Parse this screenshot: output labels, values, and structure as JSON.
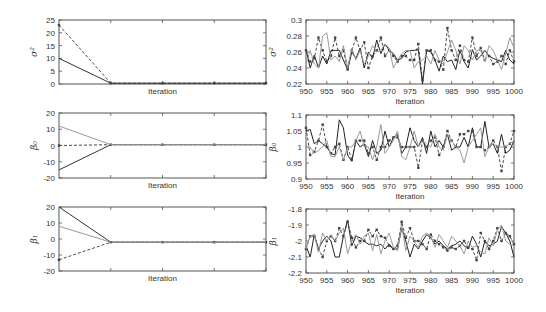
{
  "chart_data": [
    {
      "id": "sigma2-burnin",
      "type": "line",
      "ylabel": "σ²",
      "xlabel": "Iteration",
      "box": [
        59,
        20,
        266,
        84
      ],
      "ylim": [
        0,
        25
      ],
      "xlim": [
        0,
        4
      ],
      "yticks": [
        0,
        5,
        10,
        15,
        20,
        25
      ],
      "xticks": [],
      "series": [
        {
          "name": "chain-solid",
          "style": "solid",
          "color": "#333333",
          "x": [
            0,
            1,
            2,
            3,
            4
          ],
          "y": [
            10,
            0.3,
            0.3,
            0.3,
            0.3
          ]
        },
        {
          "name": "chain-dashed",
          "style": "dashed",
          "color": "#333333",
          "x": [
            0,
            1,
            2,
            3,
            4
          ],
          "y": [
            23,
            0.3,
            0.3,
            0.3,
            0.3
          ]
        }
      ]
    },
    {
      "id": "sigma2-trace",
      "type": "line",
      "ylabel": "σ²",
      "xlabel": "Iteration",
      "box": [
        306,
        20,
        514,
        84
      ],
      "ylim": [
        0.22,
        0.3
      ],
      "xlim": [
        950,
        1000
      ],
      "yticks": [
        0.22,
        0.24,
        0.26,
        0.28,
        0.3
      ],
      "xticks": [
        950,
        955,
        960,
        965,
        970,
        975,
        980,
        985,
        990,
        995,
        1000
      ],
      "series": [
        {
          "name": "chain-solid",
          "style": "solid",
          "color": "#222222",
          "y": [
            0.263,
            0.24,
            0.256,
            0.24,
            0.255,
            0.245,
            0.262,
            0.262,
            0.262,
            0.25,
            0.238,
            0.26,
            0.252,
            0.265,
            0.24,
            0.26,
            0.252,
            0.275,
            0.258,
            0.27,
            0.262,
            0.258,
            0.25,
            0.252,
            0.26,
            0.262,
            0.262,
            0.263,
            0.22,
            0.262,
            0.26,
            0.25,
            0.236,
            0.255,
            0.248,
            0.25,
            0.238,
            0.262,
            0.248,
            0.24,
            0.263,
            0.25,
            0.255,
            0.262,
            0.255,
            0.252,
            0.25,
            0.248,
            0.262,
            0.25,
            0.245
          ]
        },
        {
          "name": "chain-dashed",
          "style": "dashed",
          "color": "#333333",
          "y": [
            0.262,
            0.248,
            0.252,
            0.278,
            0.262,
            0.248,
            0.255,
            0.278,
            0.255,
            0.262,
            0.238,
            0.262,
            0.278,
            0.262,
            0.272,
            0.24,
            0.255,
            0.262,
            0.278,
            0.255,
            0.262,
            0.255,
            0.248,
            0.255,
            0.255,
            0.25,
            0.25,
            0.27,
            0.225,
            0.262,
            0.262,
            0.25,
            0.248,
            0.238,
            0.29,
            0.262,
            0.25,
            0.268,
            0.25,
            0.248,
            0.278,
            0.255,
            0.265,
            0.25,
            0.255,
            0.245,
            0.248,
            0.255,
            0.245,
            0.262,
            0.248
          ]
        },
        {
          "name": "chain-gray",
          "style": "solid",
          "color": "#9a9a9a",
          "y": [
            0.245,
            0.262,
            0.245,
            0.24,
            0.28,
            0.284,
            0.25,
            0.255,
            0.248,
            0.268,
            0.24,
            0.265,
            0.25,
            0.262,
            0.245,
            0.255,
            0.268,
            0.26,
            0.262,
            0.27,
            0.265,
            0.24,
            0.25,
            0.258,
            0.262,
            0.262,
            0.24,
            0.248,
            0.25,
            0.255,
            0.245,
            0.262,
            0.25,
            0.245,
            0.26,
            0.275,
            0.262,
            0.245,
            0.268,
            0.262,
            0.25,
            0.262,
            0.262,
            0.248,
            0.268,
            0.262,
            0.25,
            0.238,
            0.258,
            0.278,
            0.265
          ]
        }
      ]
    },
    {
      "id": "beta0-burnin",
      "type": "line",
      "ylabel": "β₀",
      "xlabel": "Iteration",
      "box": [
        59,
        113,
        266,
        178
      ],
      "ylim": [
        -20,
        20
      ],
      "xlim": [
        0,
        4
      ],
      "yticks": [
        -20,
        -10,
        0,
        10,
        20
      ],
      "xticks": [],
      "series": [
        {
          "name": "chain-solid",
          "style": "solid",
          "color": "#333333",
          "x": [
            0,
            1,
            2,
            3,
            4
          ],
          "y": [
            -15,
            0.5,
            0.5,
            0.5,
            0.5
          ]
        },
        {
          "name": "chain-dashed",
          "style": "dashed",
          "color": "#333333",
          "x": [
            0,
            1,
            2,
            3,
            4
          ],
          "y": [
            0,
            0.5,
            0.5,
            0.5,
            0.5
          ]
        },
        {
          "name": "chain-gray",
          "style": "solid",
          "color": "#9a9a9a",
          "x": [
            0,
            1,
            2,
            3,
            4
          ],
          "y": [
            12,
            0.5,
            0.5,
            0.5,
            0.5
          ]
        }
      ]
    },
    {
      "id": "beta0-trace",
      "type": "line",
      "ylabel": "β₀",
      "xlabel": "Iteration",
      "box": [
        306,
        115,
        514,
        179
      ],
      "ylim": [
        0.9,
        1.1
      ],
      "xlim": [
        950,
        1000
      ],
      "yticks": [
        0.9,
        0.95,
        1,
        1.05,
        1.1
      ],
      "xticks": [
        950,
        955,
        960,
        965,
        970,
        975,
        980,
        985,
        990,
        995,
        1000
      ],
      "series": [
        {
          "name": "chain-solid",
          "style": "solid",
          "color": "#222222",
          "y": [
            1.05,
            1.055,
            1.01,
            1.02,
            1.01,
            1.0,
            0.98,
            0.975,
            1.085,
            1.06,
            0.975,
            0.955,
            1.02,
            1.0,
            1.01,
            0.97,
            1.02,
            0.98,
            0.99,
            1.05,
            1.0,
            1.03,
            1.04,
            0.98,
            1.0,
            1.06,
            1.02,
            1.0,
            1.03,
            0.98,
            1.05,
            1.0,
            1.02,
            1.0,
            1.04,
            0.99,
            1.0,
            1.0,
            1.03,
            1.0,
            1.06,
            1.0,
            1.0,
            1.08,
            1.0,
            1.01,
            0.98,
            1.04,
            0.98,
            0.99,
            1.02
          ]
        },
        {
          "name": "chain-dashed",
          "style": "dashed",
          "color": "#333333",
          "y": [
            1.06,
            0.975,
            0.985,
            1.02,
            1.07,
            1.0,
            0.98,
            1.0,
            1.01,
            0.96,
            1.0,
            0.96,
            1.02,
            1.02,
            1.02,
            0.98,
            1.0,
            0.96,
            1.0,
            1.0,
            1.02,
            1.03,
            1.03,
            1.0,
            1.0,
            1.0,
            1.0,
            0.935,
            1.02,
            1.0,
            1.02,
            1.03,
            0.975,
            1.0,
            1.05,
            1.02,
            1.0,
            1.04,
            1.04,
            1.05,
            1.05,
            1.0,
            1.0,
            0.99,
            1.0,
            1.02,
            1.0,
            0.925,
            1.0,
            1.01,
            1.05
          ]
        },
        {
          "name": "chain-gray",
          "style": "solid",
          "color": "#9a9a9a",
          "y": [
            1.0,
            1.0,
            0.98,
            0.99,
            1.0,
            1.02,
            0.97,
            0.97,
            1.0,
            0.96,
            1.0,
            1.0,
            1.02,
            1.05,
            1.0,
            1.0,
            0.96,
            1.0,
            1.07,
            0.98,
            1.0,
            1.02,
            1.05,
            0.97,
            0.96,
            1.0,
            1.05,
            1.0,
            1.02,
            1.01,
            1.0,
            1.04,
            1.0,
            0.99,
            1.04,
            1.02,
            1.0,
            0.99,
            0.95,
            1.0,
            1.02,
            1.04,
            1.06,
            0.97,
            1.0,
            1.01,
            1.0,
            1.0,
            1.0,
            1.01,
            1.02
          ]
        }
      ]
    },
    {
      "id": "beta1-burnin",
      "type": "line",
      "ylabel": "β₁",
      "xlabel": "Iteration",
      "box": [
        59,
        207,
        266,
        271
      ],
      "ylim": [
        -20,
        20
      ],
      "xlim": [
        0,
        4
      ],
      "yticks": [
        -20,
        -10,
        0,
        10,
        20
      ],
      "xticks": [],
      "series": [
        {
          "name": "chain-solid",
          "style": "solid",
          "color": "#333333",
          "x": [
            0,
            1,
            2,
            3,
            4
          ],
          "y": [
            20,
            -2,
            -2,
            -2,
            -2
          ]
        },
        {
          "name": "chain-dashed",
          "style": "dashed",
          "color": "#333333",
          "x": [
            0,
            1,
            2,
            3,
            4
          ],
          "y": [
            -13,
            -2,
            -2,
            -2,
            -2
          ]
        },
        {
          "name": "chain-gray",
          "style": "solid",
          "color": "#9a9a9a",
          "x": [
            0,
            1,
            2,
            3,
            4
          ],
          "y": [
            8,
            -2,
            -2,
            -2,
            -2
          ]
        }
      ]
    },
    {
      "id": "beta1-trace",
      "type": "line",
      "ylabel": "β₁",
      "xlabel": "Iteration",
      "box": [
        306,
        209,
        514,
        273
      ],
      "ylim": [
        -2.2,
        -1.8
      ],
      "xlim": [
        950,
        1000
      ],
      "yticks": [
        -2.2,
        -2.1,
        -2.0,
        -1.9,
        -1.8
      ],
      "xticks": [
        950,
        955,
        960,
        965,
        970,
        975,
        980,
        985,
        990,
        995,
        1000
      ],
      "series": [
        {
          "name": "chain-solid",
          "style": "solid",
          "color": "#222222",
          "y": [
            -2.03,
            -2.1,
            -1.96,
            -2.05,
            -2.0,
            -1.97,
            -2.0,
            -2.1,
            -2.1,
            -1.97,
            -1.87,
            -2.03,
            -1.97,
            -1.98,
            -2.0,
            -2.02,
            -2.02,
            -2.03,
            -2.02,
            -2.05,
            -2.02,
            -2.05,
            -2.05,
            -1.92,
            -2.0,
            -2.1,
            -2.02,
            -2.05,
            -2.0,
            -1.96,
            -1.98,
            -2.02,
            -2.0,
            -2.03,
            -2.05,
            -2.03,
            -2.02,
            -2.0,
            -2.03,
            -2.05,
            -1.97,
            -2.02,
            -2.1,
            -2.0,
            -2.03,
            -2.02,
            -2.0,
            -1.91,
            -1.95,
            -2.0,
            -2.1
          ]
        },
        {
          "name": "chain-dashed",
          "style": "dashed",
          "color": "#333333",
          "y": [
            -2.05,
            -1.97,
            -1.97,
            -2.05,
            -2.1,
            -2.0,
            -1.97,
            -2.0,
            -1.92,
            -1.97,
            -1.88,
            -1.98,
            -2.04,
            -2.0,
            -2.0,
            -1.93,
            -1.97,
            -1.93,
            -1.97,
            -1.98,
            -2.03,
            -2.05,
            -2.03,
            -1.88,
            -1.98,
            -1.92,
            -2.0,
            -2.0,
            -2.02,
            -2.05,
            -1.96,
            -2.0,
            -2.02,
            -2.04,
            -2.06,
            -2.04,
            -2.05,
            -2.03,
            -2.0,
            -2.04,
            -2.05,
            -2.12,
            -1.95,
            -2.0,
            -2.05,
            -2.0,
            -1.92,
            -2.0,
            -1.95,
            -1.97,
            -2.02
          ]
        },
        {
          "name": "chain-gray",
          "style": "solid",
          "color": "#9a9a9a",
          "y": [
            -2.05,
            -1.97,
            -1.96,
            -2.07,
            -1.95,
            -2.0,
            -1.96,
            -2.0,
            -1.95,
            -1.92,
            -2.08,
            -2.0,
            -1.96,
            -2.02,
            -1.97,
            -1.95,
            -2.06,
            -1.96,
            -2.08,
            -2.0,
            -1.95,
            -2.04,
            -2.06,
            -1.9,
            -2.06,
            -1.97,
            -2.0,
            -2.04,
            -1.97,
            -1.95,
            -1.97,
            -2.04,
            -1.96,
            -2.0,
            -2.04,
            -1.97,
            -2.0,
            -2.03,
            -2.08,
            -2.0,
            -2.04,
            -2.03,
            -2.07,
            -2.08,
            -1.98,
            -2.03,
            -1.93,
            -1.9,
            -2.0,
            -2.02,
            -2.03
          ]
        }
      ]
    }
  ]
}
